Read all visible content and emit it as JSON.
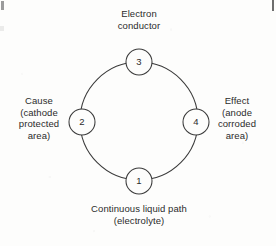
{
  "diagram": {
    "title_hidden": "",
    "ink_color": "#3a3a3a",
    "background_color": "#fdfdfc",
    "ring": {
      "center_x": 139,
      "center_y": 121,
      "radius": 59
    },
    "nodes": [
      {
        "id": "node-3",
        "number": "3",
        "position": "top",
        "cx": 139,
        "cy": 62,
        "r": 13
      },
      {
        "id": "node-2",
        "number": "2",
        "position": "left",
        "cx": 82,
        "cy": 122,
        "r": 13
      },
      {
        "id": "node-4",
        "number": "4",
        "position": "right",
        "cx": 196,
        "cy": 122,
        "r": 13
      },
      {
        "id": "node-1",
        "number": "1",
        "position": "bottom",
        "cx": 139,
        "cy": 181,
        "r": 13
      }
    ],
    "labels": {
      "top": {
        "lines": [
          "Electron",
          "conductor"
        ]
      },
      "left": {
        "lines": [
          "Cause",
          "(cathode",
          "protected",
          "area)"
        ]
      },
      "right": {
        "lines": [
          "Effect",
          "(anode",
          "corroded",
          "area)"
        ]
      },
      "bottom": {
        "lines": [
          "Continuous liquid path",
          "(electrolyte)"
        ]
      }
    }
  }
}
